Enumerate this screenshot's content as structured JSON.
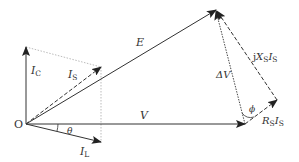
{
  "diagram": {
    "colors": {
      "line": "#333333",
      "dotted": "#aaaaaa",
      "background": "#ffffff"
    },
    "points": {
      "origin": [
        26,
        124
      ],
      "ic_tip": [
        26,
        47
      ],
      "is_tip": [
        101,
        67
      ],
      "il_tip": [
        101,
        142
      ],
      "v_tip": [
        245,
        124
      ],
      "e_tip": [
        216,
        10
      ],
      "rs_tip": [
        277,
        100
      ]
    },
    "labels": {
      "origin": "O",
      "ic": "I",
      "ic_sub": "C",
      "is": "I",
      "is_sub": "S",
      "il": "I",
      "il_sub": "L",
      "theta": "θ",
      "e": "E",
      "v": "V",
      "delta_v": "ΔV",
      "phi": "ϕ",
      "jxsis_j": "j",
      "jxsis_x": "X",
      "jxsis_xsub": "S",
      "jxsis_i": "I",
      "jxsis_isub": "S",
      "rsis_r": "R",
      "rsis_rsub": "S",
      "rsis_i": "I",
      "rsis_isub": "S"
    }
  }
}
